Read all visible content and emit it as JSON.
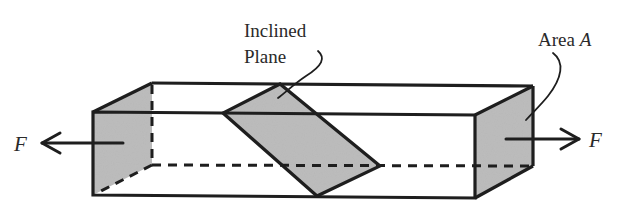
{
  "diagram": {
    "colors": {
      "stroke": "#1e1e1e",
      "shade": "#bdbdbd",
      "background": "#ffffff",
      "text": "#2a2a2a"
    },
    "labels": {
      "inclined_plane_line1": "Inclined",
      "inclined_plane_line2": "Plane",
      "area_prefix": "Area ",
      "area_symbol": "A",
      "force_left": "F",
      "force_right": "F"
    },
    "elements": [
      {
        "id": "bar",
        "type": "rectangular-prism",
        "description": "Long rectangular bar drawn in oblique projection"
      },
      {
        "id": "left-end-face",
        "type": "shaded-face",
        "description": "Shaded cross-section at left end"
      },
      {
        "id": "right-end-face",
        "type": "shaded-face",
        "description": "Shaded cross-section at right end, labeled Area A"
      },
      {
        "id": "inclined-plane",
        "type": "shaded-face",
        "description": "Shaded inclined section through the bar"
      },
      {
        "id": "force-left",
        "type": "arrow",
        "direction": "left",
        "label": "F"
      },
      {
        "id": "force-right",
        "type": "arrow",
        "direction": "right",
        "label": "F"
      }
    ]
  }
}
